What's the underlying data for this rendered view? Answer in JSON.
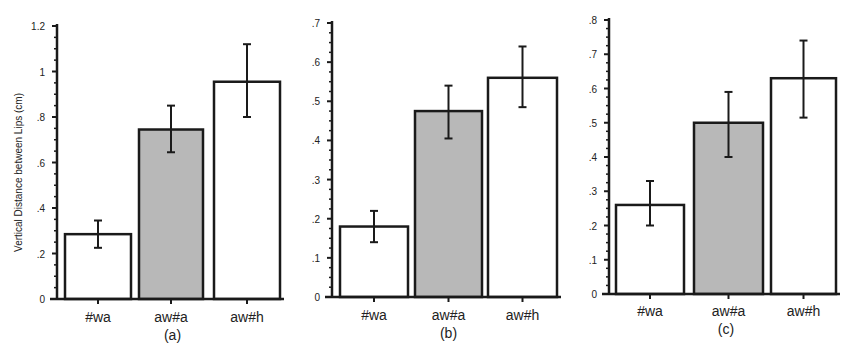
{
  "chart_data": [
    {
      "type": "bar",
      "panel_label": "(a)",
      "categories": [
        "#wa",
        "aw#a",
        "aw#h"
      ],
      "values": [
        0.285,
        0.745,
        0.955
      ],
      "error_low": [
        0.225,
        0.645,
        0.8
      ],
      "error_high": [
        0.345,
        0.85,
        1.12
      ],
      "fills": [
        "#ffffff",
        "#b8b8b8",
        "#ffffff"
      ],
      "ylabel": "Vertical Distance between Lips (cm)",
      "ylim": [
        0,
        1.2
      ],
      "yticks": [
        0,
        0.2,
        0.4,
        0.6,
        0.8,
        1,
        1.2
      ],
      "ytick_labels": [
        "0",
        ".2",
        ".4",
        ".6",
        ".8",
        "1",
        "1.2"
      ],
      "grid": false,
      "layout": {
        "axis_x": 57,
        "y0": 299,
        "ytop": 26,
        "bars": [
          [
            65,
            131
          ],
          [
            139,
            203
          ],
          [
            214,
            280
          ]
        ],
        "label_y": 322,
        "panel_y": 340,
        "ylabel_x": 18
      }
    },
    {
      "type": "bar",
      "panel_label": "(b)",
      "categories": [
        "#wa",
        "aw#a",
        "aw#h"
      ],
      "values": [
        0.18,
        0.475,
        0.56
      ],
      "error_low": [
        0.14,
        0.405,
        0.485
      ],
      "error_high": [
        0.22,
        0.54,
        0.64
      ],
      "fills": [
        "#ffffff",
        "#b8b8b8",
        "#ffffff"
      ],
      "ylabel": "",
      "ylim": [
        0,
        0.7
      ],
      "yticks": [
        0,
        0.1,
        0.2,
        0.3,
        0.4,
        0.5,
        0.6,
        0.7
      ],
      "ytick_labels": [
        "0",
        ".1",
        ".2",
        ".3",
        ".4",
        ".5",
        ".6",
        ".7"
      ],
      "grid": false,
      "layout": {
        "axis_x": 332,
        "y0": 297,
        "ytop": 23,
        "bars": [
          [
            340,
            408
          ],
          [
            415,
            482
          ],
          [
            488,
            557
          ]
        ],
        "label_y": 320,
        "panel_y": 338,
        "ylabel_x": 0
      }
    },
    {
      "type": "bar",
      "panel_label": "(c)",
      "categories": [
        "#wa",
        "aw#a",
        "aw#h"
      ],
      "values": [
        0.26,
        0.5,
        0.63
      ],
      "error_low": [
        0.2,
        0.4,
        0.515
      ],
      "error_high": [
        0.33,
        0.59,
        0.74
      ],
      "fills": [
        "#ffffff",
        "#b8b8b8",
        "#ffffff"
      ],
      "ylabel": "",
      "ylim": [
        0,
        0.8
      ],
      "yticks": [
        0,
        0.1,
        0.2,
        0.3,
        0.4,
        0.5,
        0.6,
        0.7,
        0.8
      ],
      "ytick_labels": [
        "0",
        ".1",
        ".2",
        ".3",
        ".4",
        ".5",
        ".6",
        ".7",
        ".8"
      ],
      "grid": false,
      "layout": {
        "axis_x": 609,
        "y0": 294,
        "ytop": 20,
        "bars": [
          [
            616,
            684
          ],
          [
            694,
            763
          ],
          [
            771,
            836
          ]
        ],
        "label_y": 316,
        "panel_y": 334,
        "ylabel_x": 0
      }
    }
  ]
}
